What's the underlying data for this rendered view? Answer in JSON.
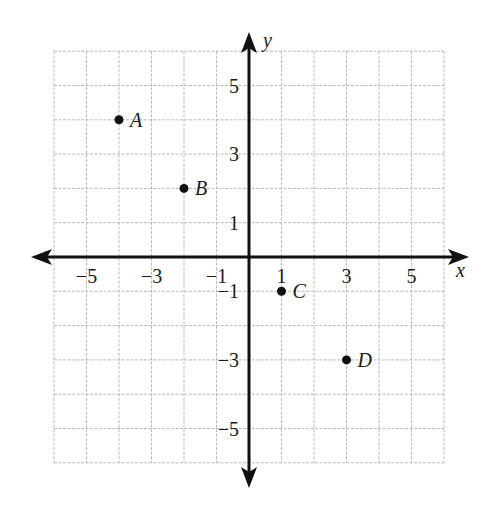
{
  "chart_data": {
    "type": "scatter",
    "title": "",
    "xlabel": "x",
    "ylabel": "y",
    "xlim": [
      -6,
      6
    ],
    "ylim": [
      -6,
      6
    ],
    "grid": true,
    "x_tick_labels": [
      "−5",
      "−3",
      "−1",
      "1",
      "3",
      "5"
    ],
    "x_tick_values": [
      -5,
      -3,
      -1,
      1,
      3,
      5
    ],
    "y_tick_labels": [
      "5",
      "3",
      "1",
      "−1",
      "−3",
      "−5"
    ],
    "y_tick_values": [
      5,
      3,
      1,
      -1,
      -3,
      -5
    ],
    "points": [
      {
        "label": "A",
        "x": -4,
        "y": 4
      },
      {
        "label": "B",
        "x": -2,
        "y": 2
      },
      {
        "label": "C",
        "x": 1,
        "y": -1
      },
      {
        "label": "D",
        "x": 3,
        "y": -3
      }
    ]
  },
  "colors": {
    "axis": "#111111",
    "grid": "#b9b9b9",
    "point": "#111111",
    "background": "#ffffff"
  }
}
